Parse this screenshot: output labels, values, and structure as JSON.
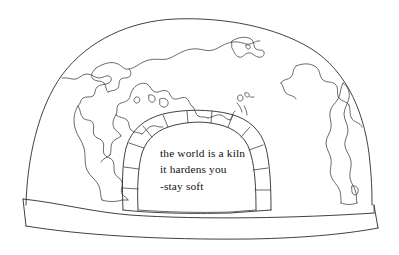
{
  "artwork": {
    "title": "the world is a kiln",
    "medium": "line drawing",
    "subject": "dome kiln with world map surface and arched opening",
    "background_color": "#ffffff",
    "ink_color": "#2b2b2b",
    "text_color": "#111111"
  },
  "quote": {
    "lines": [
      "the world is a kiln",
      "it hardens you",
      "-stay soft"
    ],
    "line1": "the world is a kiln",
    "line2": "it hardens you",
    "line3": "-stay soft"
  },
  "parts": {
    "dome_label": "kiln-dome",
    "base_label": "kiln-base-plinth",
    "arch_label": "kiln-arch-opening",
    "map_label": "world-map-continents",
    "bricks_label": "arch-voussoir-bricks"
  }
}
